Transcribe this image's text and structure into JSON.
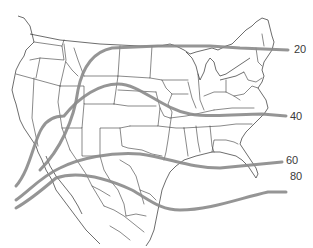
{
  "map": {
    "region": "United States and northern Mexico outline with state borders",
    "isoline_color": "#8a8a8a",
    "border_color": "#3a3a3a",
    "background": "#ffffff"
  },
  "isolines": [
    {
      "value": "20",
      "label": "20"
    },
    {
      "value": "40",
      "label": "40"
    },
    {
      "value": "60",
      "label": "60"
    },
    {
      "value": "80",
      "label": "80"
    }
  ]
}
